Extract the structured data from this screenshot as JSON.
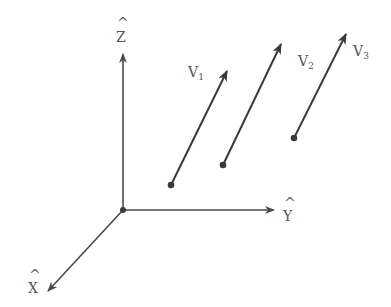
{
  "diagram": {
    "title": "",
    "colors": {
      "line": "#4a4a4a",
      "vector": "#3a3a3a",
      "label": "#555555",
      "background": "#ffffff"
    },
    "axes": {
      "origin": [
        123,
        210
      ],
      "z": {
        "label": "Z",
        "hat": "^",
        "tip": [
          123,
          52
        ]
      },
      "y": {
        "label": "Y",
        "hat": "^",
        "tip": [
          276,
          210
        ]
      },
      "x": {
        "label": "X",
        "hat": "^",
        "tip": [
          47,
          292
        ]
      }
    },
    "vectors": [
      {
        "name": "V",
        "sub": "1",
        "start": [
          171,
          185
        ],
        "end": [
          228,
          69
        ]
      },
      {
        "name": "V",
        "sub": "2",
        "start": [
          223,
          165
        ],
        "end": [
          282,
          42
        ]
      },
      {
        "name": "V",
        "sub": "3",
        "start": [
          294,
          138
        ],
        "end": [
          347,
          32
        ]
      }
    ]
  }
}
